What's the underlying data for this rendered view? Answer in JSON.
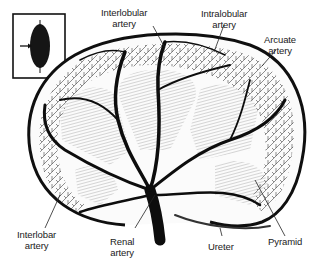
{
  "figure": {
    "colors": {
      "ink": "#111111",
      "background": "#ffffff"
    },
    "inset": {
      "description": "Whole kidney with arrow indicating plane of section",
      "icon": "kidney-inset-icon"
    }
  },
  "labels": [
    {
      "id": "interlobular",
      "line1": "Interlobular",
      "line2": "artery"
    },
    {
      "id": "intralobular",
      "line1": "Intralobular",
      "line2": "artery"
    },
    {
      "id": "arcuate",
      "line1": "Arcuate",
      "line2": "artery"
    },
    {
      "id": "interlobar",
      "line1": "Interlobar",
      "line2": "artery"
    },
    {
      "id": "renal",
      "line1": "Renal",
      "line2": "artery"
    },
    {
      "id": "ureter",
      "line1": "Ureter",
      "line2": ""
    },
    {
      "id": "pyramid",
      "line1": "Pyramid",
      "line2": ""
    }
  ]
}
